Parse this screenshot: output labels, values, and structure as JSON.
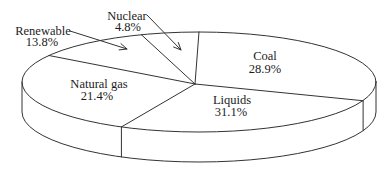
{
  "figure": {
    "background": "#ffffff",
    "stroke_color": "#333333",
    "text_color": "#1c1c1c"
  },
  "chart_data": {
    "type": "pie",
    "projection": "3d-perspective",
    "fill_style": "outline-only-white",
    "title": "",
    "legend": "none",
    "order_clockwise_from_top": [
      "Coal",
      "Liquids",
      "Natural gas",
      "Renewable",
      "Nuclear"
    ],
    "slices": [
      {
        "label": "Coal",
        "value": 28.9,
        "value_label": "28.9%"
      },
      {
        "label": "Liquids",
        "value": 31.1,
        "value_label": "31.1%"
      },
      {
        "label": "Natural gas",
        "value": 21.4,
        "value_label": "21.4%"
      },
      {
        "label": "Renewable",
        "value": 13.8,
        "value_label": "13.8%"
      },
      {
        "label": "Nuclear",
        "value": 4.8,
        "value_label": "4.8%"
      }
    ],
    "layout": {
      "ellipse": {
        "cx": 199,
        "cy": 82,
        "rx": 177,
        "ry": 50
      },
      "depth": 30,
      "apex": {
        "x": 195,
        "y": 84
      },
      "boundary_angles_deg": [
        270,
        22,
        116,
        212,
        251
      ],
      "arrows": [
        {
          "for": "Renewable",
          "x1": 70,
          "y1": 31,
          "x2": 127,
          "y2": 49
        },
        {
          "for": "Nuclear",
          "x1": 147,
          "y1": 15,
          "x2": 181,
          "y2": 50
        }
      ]
    }
  }
}
